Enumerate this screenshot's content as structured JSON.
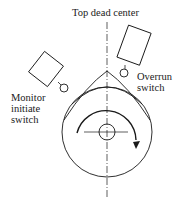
{
  "diagram": {
    "labels": {
      "top": "Top dead center",
      "right": "Overrun\nswitch",
      "left": "Monitor\ninitiate\nswitch"
    },
    "colors": {
      "stroke": "#1a1a1a",
      "background": "#ffffff"
    }
  }
}
